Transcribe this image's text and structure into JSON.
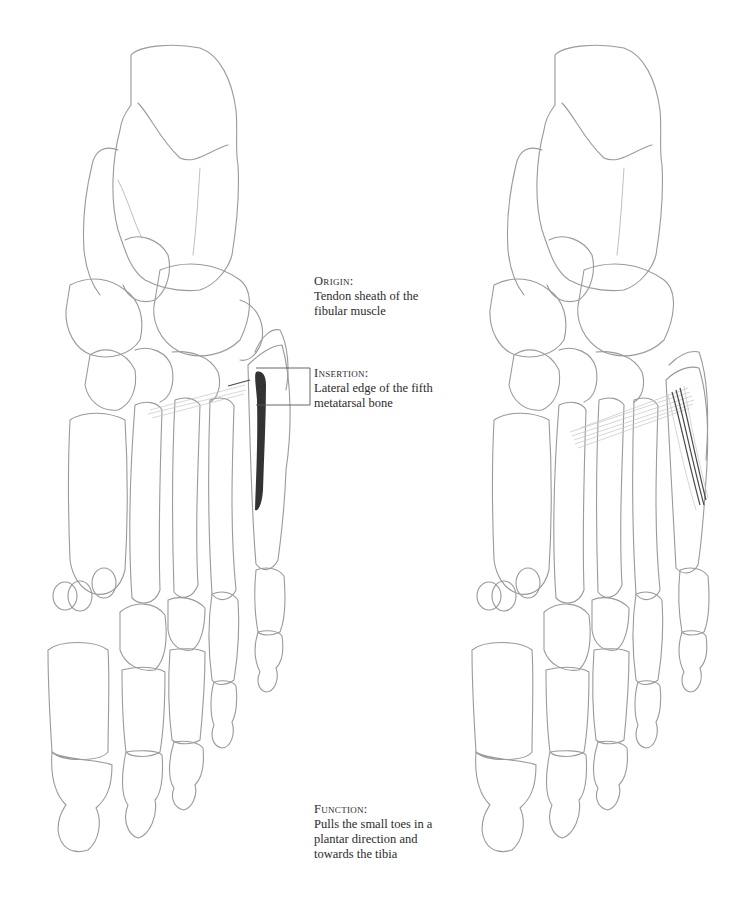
{
  "figure": {
    "left_drawing": "foot skeleton, dorsal view, with highlighted insertion on fifth metatarsal",
    "right_drawing": "foot skeleton, dorsal view, with fibular muscle tendon fibers"
  },
  "labels": {
    "origin": {
      "heading": "Origin:",
      "lines": [
        "Tendon sheath of the",
        "fibular muscle"
      ]
    },
    "insertion": {
      "heading": "Insertion:",
      "lines": [
        "Lateral edge of the fifth",
        "metatarsal bone"
      ]
    },
    "function": {
      "heading": "Function:",
      "lines": [
        "Pulls the small toes in a",
        "plantar direction and",
        "towards the tibia"
      ]
    }
  },
  "colors": {
    "pencil": "#9a9a9a",
    "highlight": "#333333",
    "text": "#2b2b2b"
  }
}
